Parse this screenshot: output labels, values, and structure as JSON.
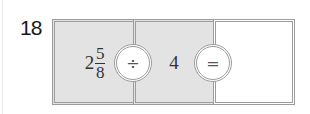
{
  "question": {
    "number": "18",
    "expression": {
      "dividend": {
        "whole": "2",
        "numerator": "5",
        "denominator": "8"
      },
      "operator": "÷",
      "divisor": "4",
      "equals": "=",
      "answer": ""
    }
  },
  "colors": {
    "shaded_cell": "#e3e3e3",
    "border": "#9c9c9c",
    "answer_cell": "#ffffff"
  }
}
